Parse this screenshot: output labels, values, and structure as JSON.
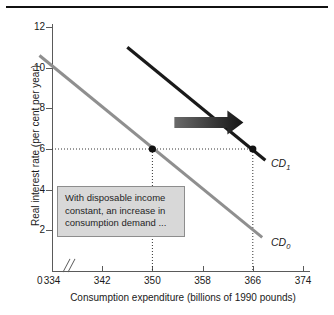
{
  "chart_data": {
    "type": "line",
    "title": "",
    "xlabel": "Consumption expenditure (billions of 1990 pounds)",
    "ylabel": "Real interest rate (per cent per year)",
    "xlim": [
      330,
      374
    ],
    "ylim": [
      0,
      12
    ],
    "x_ticks": [
      334,
      342,
      350,
      358,
      366,
      374
    ],
    "x_tick_labels": [
      "334",
      "342",
      "350",
      "358",
      "366",
      "374"
    ],
    "y_ticks": [
      0,
      2,
      4,
      6,
      8,
      10,
      12
    ],
    "y_tick_labels": [
      "0",
      "2",
      "4",
      "6",
      "8",
      "10",
      "12"
    ],
    "origin_label": "0",
    "axis_break": true,
    "grid": false,
    "legend": "none",
    "series": [
      {
        "name": "CD0",
        "label": "CD",
        "label_sub": "0",
        "color": "#8f8f8f",
        "x": [
          332.0,
          367.5
        ],
        "y": [
          10.6,
          1.65
        ]
      },
      {
        "name": "CD1",
        "label": "CD",
        "label_sub": "1",
        "color": "#1a1a1a",
        "x": [
          346.0,
          368.0
        ],
        "y": [
          11.0,
          5.45
        ]
      }
    ],
    "points": [
      {
        "name": "equilibrium-cd0",
        "x": 350,
        "y": 6,
        "color": "#111111"
      },
      {
        "name": "equilibrium-cd1",
        "x": 366,
        "y": 6,
        "color": "#111111"
      }
    ],
    "reference_lines": [
      {
        "name": "horizontal-6",
        "orientation": "horizontal",
        "value": 6,
        "style": "dotted"
      },
      {
        "name": "vertical-350",
        "orientation": "vertical",
        "value": 350,
        "style": "dotted"
      },
      {
        "name": "vertical-366",
        "orientation": "vertical",
        "value": 366,
        "style": "dotted"
      }
    ],
    "annotations": [
      {
        "name": "shift-arrow",
        "type": "arrow",
        "direction": "right",
        "from_x": 353.5,
        "to_x": 364.5,
        "y": 7.3,
        "color": "#2b2b2b"
      },
      {
        "name": "note-textbox",
        "type": "textbox",
        "lines": [
          "With disposable income",
          "constant, an increase in",
          "consumption demand ..."
        ],
        "background": "#d8d8d8",
        "border": "#8d8d8d"
      }
    ]
  },
  "figure": {
    "top_rule_color": "#111111",
    "background": "#ffffff"
  }
}
